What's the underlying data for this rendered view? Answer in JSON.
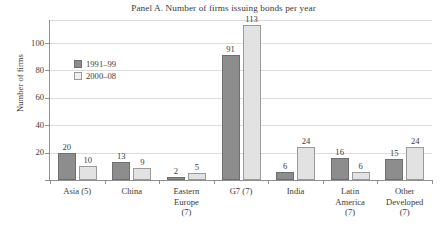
{
  "chart_data": {
    "type": "bar",
    "title": "Panel A. Number of firms issuing bonds per year",
    "xlabel": "",
    "ylabel": "Number of firms",
    "ylim": [
      0,
      120
    ],
    "yticks": [
      0,
      20,
      40,
      60,
      80,
      100
    ],
    "ytick_labels": [
      "",
      "20",
      "40",
      "60",
      "80",
      "100"
    ],
    "grid": true,
    "legend_position": "upper left inside",
    "categories": [
      "Asia (5)",
      "China",
      "Eastern\nEurope\n(7)",
      "G7 (7)",
      "India",
      "Latin\nAmerica\n(7)",
      "Other\nDeveloped\n(7)"
    ],
    "series": [
      {
        "name": "1991–99",
        "color": "#8d8d8d",
        "values": [
          20,
          13,
          2,
          91,
          6,
          16,
          15
        ]
      },
      {
        "name": "2000–08",
        "color": "#e2e2e2",
        "values": [
          10,
          9,
          5,
          113,
          24,
          6,
          24
        ]
      }
    ],
    "data_labels": [
      [
        "20",
        "13",
        "2",
        "91",
        "6",
        "16",
        "15"
      ],
      [
        "10",
        "9",
        "5",
        "113",
        "24",
        "6",
        "24"
      ]
    ]
  }
}
